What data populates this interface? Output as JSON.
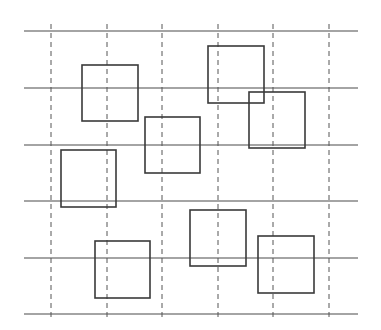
{
  "diagram": {
    "width": 381,
    "height": 330,
    "background": "#ffffff",
    "line_color": "#4a4a4a",
    "dash_color": "#555555",
    "square_color": "#3a3a3a",
    "horizontal_lines": {
      "x_start": 24,
      "x_end": 358,
      "y": [
        31,
        88,
        145,
        201,
        258,
        314
      ]
    },
    "vertical_dashed_lines": {
      "y_start": 24,
      "y_end": 320,
      "x": [
        51,
        107,
        162,
        218,
        273,
        329
      ]
    },
    "squares": [
      {
        "id": 1,
        "x": 82,
        "y": 65,
        "w": 56,
        "h": 56
      },
      {
        "id": 2,
        "x": 208,
        "y": 46,
        "w": 56,
        "h": 57
      },
      {
        "id": 3,
        "x": 249,
        "y": 92,
        "w": 56,
        "h": 56
      },
      {
        "id": 4,
        "x": 145,
        "y": 117,
        "w": 55,
        "h": 56
      },
      {
        "id": 5,
        "x": 61,
        "y": 150,
        "w": 55,
        "h": 57
      },
      {
        "id": 6,
        "x": 190,
        "y": 210,
        "w": 56,
        "h": 56
      },
      {
        "id": 7,
        "x": 95,
        "y": 241,
        "w": 55,
        "h": 57
      },
      {
        "id": 8,
        "x": 258,
        "y": 236,
        "w": 56,
        "h": 57
      }
    ]
  }
}
